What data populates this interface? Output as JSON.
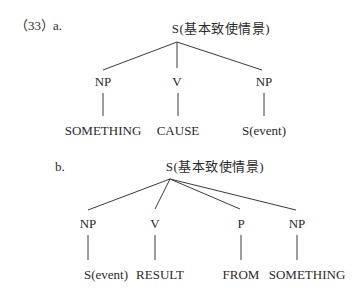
{
  "example_number": "（33）",
  "diagrams": [
    {
      "label": "a.",
      "root": "S(基本致使情景)",
      "nodes": [
        {
          "category": "NP",
          "leaf": "SOMETHING"
        },
        {
          "category": "V",
          "leaf": "CAUSE"
        },
        {
          "category": "NP",
          "leaf": "S(event)"
        }
      ]
    },
    {
      "label": "b.",
      "root": "S(基本致使情景)",
      "nodes": [
        {
          "category": "NP",
          "leaf": "S(event)"
        },
        {
          "category": "V",
          "leaf": "RESULT"
        },
        {
          "category": "P",
          "leaf": "FROM"
        },
        {
          "category": "NP",
          "leaf": "SOMETHING"
        }
      ]
    }
  ]
}
